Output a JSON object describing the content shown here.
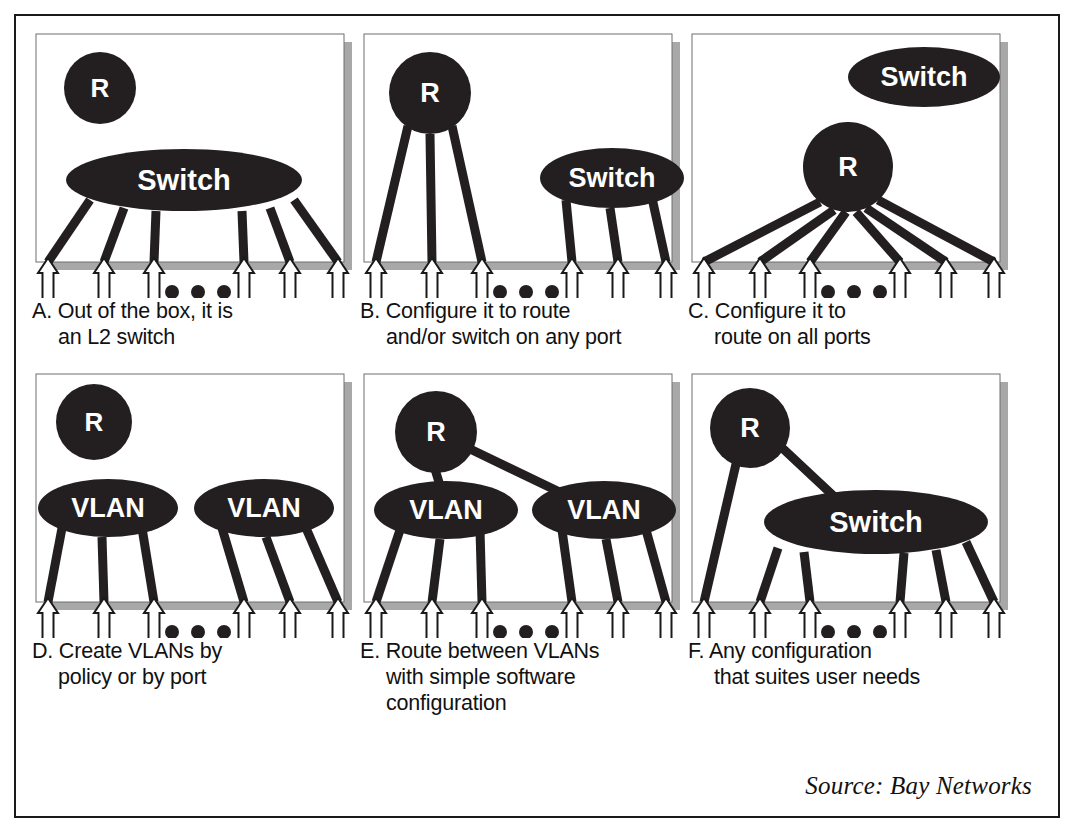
{
  "figure": {
    "source_note": "Source: Bay Networks",
    "colors": {
      "ink": "#1a1a1a",
      "node_fill": "#231f20",
      "node_label": "#ffffff",
      "panel_bg": "#ffffff",
      "panel_shadow": "#a8a8a8",
      "panel_border": "#6f6f6f",
      "arrow_fill": "#ffffff",
      "arrow_stroke": "#1a1a1a",
      "caption_text": "#111111",
      "page_bg": "#ffffff"
    },
    "ellipsis_dots": 3,
    "ports_per_panel": 6
  },
  "panels": [
    {
      "id": "A",
      "letter": "A.",
      "caption_lines": [
        "A. Out of the box, it is",
        "an L2 switch"
      ],
      "nodes": [
        {
          "name": "router-node",
          "label": "R",
          "shape": "circle",
          "cx": 68,
          "cy": 58,
          "rx": 36,
          "ry": 36,
          "font": 26
        },
        {
          "name": "switch-node",
          "label": "Switch",
          "shape": "ellipse",
          "cx": 152,
          "cy": 150,
          "rx": 118,
          "ry": 31,
          "font": 29
        }
      ],
      "legs": [
        {
          "from": "switch-node",
          "x1": 58,
          "y1": 170,
          "x2": 16,
          "y2": 232
        },
        {
          "from": "switch-node",
          "x1": 92,
          "y1": 178,
          "x2": 72,
          "y2": 232
        },
        {
          "from": "switch-node",
          "x1": 124,
          "y1": 181,
          "x2": 122,
          "y2": 232
        },
        {
          "from": "switch-node",
          "x1": 210,
          "y1": 181,
          "x2": 212,
          "y2": 232
        },
        {
          "from": "switch-node",
          "x1": 238,
          "y1": 178,
          "x2": 258,
          "y2": 232
        },
        {
          "from": "switch-node",
          "x1": 262,
          "y1": 170,
          "x2": 306,
          "y2": 232
        }
      ],
      "links": []
    },
    {
      "id": "B",
      "letter": "B.",
      "caption_lines": [
        "B. Configure it to route",
        "and/or switch on any port"
      ],
      "nodes": [
        {
          "name": "router-node",
          "label": "R",
          "shape": "circle",
          "cx": 70,
          "cy": 63,
          "rx": 41,
          "ry": 41,
          "font": 27
        },
        {
          "name": "switch-node",
          "label": "Switch",
          "shape": "ellipse",
          "cx": 252,
          "cy": 148,
          "rx": 72,
          "ry": 30,
          "font": 27
        }
      ],
      "legs": [
        {
          "from": "router-node",
          "x1": 48,
          "y1": 96,
          "x2": 16,
          "y2": 232
        },
        {
          "from": "router-node",
          "x1": 70,
          "y1": 104,
          "x2": 72,
          "y2": 232
        },
        {
          "from": "router-node",
          "x1": 92,
          "y1": 96,
          "x2": 122,
          "y2": 232
        },
        {
          "from": "switch-node",
          "x1": 206,
          "y1": 170,
          "x2": 212,
          "y2": 232
        },
        {
          "from": "switch-node",
          "x1": 250,
          "y1": 178,
          "x2": 258,
          "y2": 232
        },
        {
          "from": "switch-node",
          "x1": 292,
          "y1": 168,
          "x2": 306,
          "y2": 232
        }
      ],
      "links": []
    },
    {
      "id": "C",
      "letter": "C.",
      "caption_lines": [
        "C. Configure it to",
        "route on all ports"
      ],
      "nodes": [
        {
          "name": "switch-node",
          "label": "Switch",
          "shape": "ellipse",
          "cx": 236,
          "cy": 47,
          "rx": 76,
          "ry": 30,
          "font": 27
        },
        {
          "name": "router-node",
          "label": "R",
          "shape": "circle",
          "cx": 160,
          "cy": 137,
          "rx": 45,
          "ry": 45,
          "font": 27
        }
      ],
      "legs": [
        {
          "from": "router-node",
          "x1": 132,
          "y1": 172,
          "x2": 16,
          "y2": 232
        },
        {
          "from": "router-node",
          "x1": 146,
          "y1": 180,
          "x2": 72,
          "y2": 232
        },
        {
          "from": "router-node",
          "x1": 158,
          "y1": 182,
          "x2": 122,
          "y2": 232
        },
        {
          "from": "router-node",
          "x1": 168,
          "y1": 182,
          "x2": 212,
          "y2": 232
        },
        {
          "from": "router-node",
          "x1": 178,
          "y1": 178,
          "x2": 258,
          "y2": 232
        },
        {
          "from": "router-node",
          "x1": 190,
          "y1": 170,
          "x2": 306,
          "y2": 232
        }
      ],
      "links": []
    },
    {
      "id": "D",
      "letter": "D.",
      "caption_lines": [
        "D. Create VLANs by",
        "policy or by port"
      ],
      "nodes": [
        {
          "name": "router-node",
          "label": "R",
          "shape": "circle",
          "cx": 62,
          "cy": 52,
          "rx": 38,
          "ry": 38,
          "font": 26
        },
        {
          "name": "vlan-node-left",
          "label": "VLAN",
          "shape": "ellipse",
          "cx": 76,
          "cy": 138,
          "rx": 70,
          "ry": 29,
          "font": 27
        },
        {
          "name": "vlan-node-right",
          "label": "VLAN",
          "shape": "ellipse",
          "cx": 232,
          "cy": 138,
          "rx": 70,
          "ry": 29,
          "font": 27
        }
      ],
      "legs": [
        {
          "from": "vlan-node-left",
          "x1": 30,
          "y1": 158,
          "x2": 16,
          "y2": 232
        },
        {
          "from": "vlan-node-left",
          "x1": 70,
          "y1": 167,
          "x2": 72,
          "y2": 232
        },
        {
          "from": "vlan-node-left",
          "x1": 110,
          "y1": 158,
          "x2": 122,
          "y2": 232
        },
        {
          "from": "vlan-node-right",
          "x1": 190,
          "y1": 158,
          "x2": 212,
          "y2": 232
        },
        {
          "from": "vlan-node-right",
          "x1": 234,
          "y1": 167,
          "x2": 258,
          "y2": 232
        },
        {
          "from": "vlan-node-right",
          "x1": 274,
          "y1": 158,
          "x2": 306,
          "y2": 232
        }
      ],
      "links": []
    },
    {
      "id": "E",
      "letter": "E.",
      "caption_lines": [
        "E. Route between VLANs",
        "with simple software",
        "configuration"
      ],
      "nodes": [
        {
          "name": "router-node",
          "label": "R",
          "shape": "circle",
          "cx": 76,
          "cy": 62,
          "rx": 41,
          "ry": 41,
          "font": 27
        },
        {
          "name": "vlan-node-left",
          "label": "VLAN",
          "shape": "ellipse",
          "cx": 86,
          "cy": 140,
          "rx": 72,
          "ry": 29,
          "font": 27
        },
        {
          "name": "vlan-node-right",
          "label": "VLAN",
          "shape": "ellipse",
          "cx": 244,
          "cy": 140,
          "rx": 72,
          "ry": 29,
          "font": 27
        }
      ],
      "legs": [
        {
          "from": "vlan-node-left",
          "x1": 40,
          "y1": 160,
          "x2": 16,
          "y2": 232
        },
        {
          "from": "vlan-node-left",
          "x1": 80,
          "y1": 169,
          "x2": 72,
          "y2": 232
        },
        {
          "from": "vlan-node-left",
          "x1": 120,
          "y1": 160,
          "x2": 122,
          "y2": 232
        },
        {
          "from": "vlan-node-right",
          "x1": 202,
          "y1": 160,
          "x2": 212,
          "y2": 232
        },
        {
          "from": "vlan-node-right",
          "x1": 246,
          "y1": 169,
          "x2": 258,
          "y2": 232
        },
        {
          "from": "vlan-node-right",
          "x1": 286,
          "y1": 160,
          "x2": 306,
          "y2": 232
        }
      ],
      "links": [
        {
          "name": "router-to-vlan-left-link",
          "x1": 74,
          "y1": 96,
          "x2": 82,
          "y2": 122
        },
        {
          "name": "router-to-vlan-right-link",
          "x1": 108,
          "y1": 78,
          "x2": 212,
          "y2": 128
        }
      ]
    },
    {
      "id": "F",
      "letter": "F.",
      "caption_lines": [
        "F. Any configuration",
        "that suites user needs"
      ],
      "nodes": [
        {
          "name": "router-node",
          "label": "R",
          "shape": "circle",
          "cx": 62,
          "cy": 58,
          "rx": 40,
          "ry": 40,
          "font": 27
        },
        {
          "name": "switch-node",
          "label": "Switch",
          "shape": "ellipse",
          "cx": 188,
          "cy": 152,
          "rx": 112,
          "ry": 32,
          "font": 29
        }
      ],
      "legs": [
        {
          "from": "router-node",
          "x1": 48,
          "y1": 94,
          "x2": 16,
          "y2": 232
        },
        {
          "from": "switch-node",
          "x1": 90,
          "y1": 178,
          "x2": 72,
          "y2": 232
        },
        {
          "from": "switch-node",
          "x1": 116,
          "y1": 182,
          "x2": 122,
          "y2": 232
        },
        {
          "from": "switch-node",
          "x1": 216,
          "y1": 183,
          "x2": 212,
          "y2": 232
        },
        {
          "from": "switch-node",
          "x1": 248,
          "y1": 180,
          "x2": 258,
          "y2": 232
        },
        {
          "from": "switch-node",
          "x1": 278,
          "y1": 172,
          "x2": 306,
          "y2": 232
        }
      ],
      "links": [
        {
          "name": "router-to-switch-link",
          "x1": 90,
          "y1": 74,
          "x2": 152,
          "y2": 132
        }
      ]
    }
  ]
}
